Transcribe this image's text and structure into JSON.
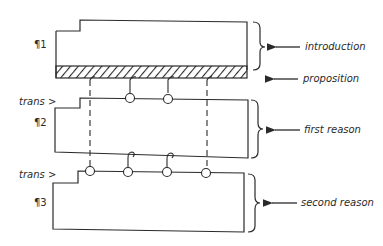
{
  "diagram": {
    "type": "essay-structure",
    "paragraphs": [
      {
        "marker": "¶1",
        "role": "introduction"
      },
      {
        "marker": "¶2",
        "role": "first reason",
        "transition": "trans >"
      },
      {
        "marker": "¶3",
        "role": "second reason",
        "transition": "trans >"
      }
    ],
    "labels": {
      "introduction": "introduction",
      "proposition": "proposition",
      "first_reason": "first reason",
      "second_reason": "second reason",
      "trans2": "trans >",
      "trans3": "trans >",
      "p1": "¶1",
      "p2": "¶2",
      "p3": "¶3"
    },
    "colors": {
      "ink": "#2a2a2a",
      "background": "#ffffff"
    }
  }
}
